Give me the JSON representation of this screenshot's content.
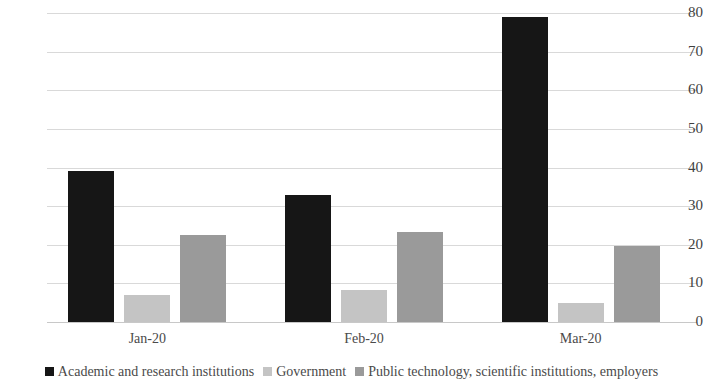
{
  "chart_data": {
    "type": "bar",
    "title": "",
    "subtitle": "",
    "xlabel": "",
    "ylabel": "",
    "categories": [
      "Jan-20",
      "Feb-20",
      "Mar-20"
    ],
    "series": [
      {
        "name": "Academic and research institutions",
        "color": "#161616",
        "values": [
          39,
          33,
          79
        ]
      },
      {
        "name": "Government",
        "color": "#c4c4c4",
        "values": [
          7,
          8.3,
          4.9
        ]
      },
      {
        "name": "Public technology, scientific institutions, employers",
        "color": "#9a9a9a",
        "values": [
          22.5,
          23.4,
          19.8
        ]
      }
    ],
    "ylim": [
      0,
      80
    ],
    "yticks": [
      0,
      10,
      20,
      30,
      40,
      50,
      60,
      70,
      80
    ],
    "ytick_labels": [
      "0",
      "10",
      "20",
      "30",
      "40",
      "50",
      "60",
      "70",
      "80"
    ],
    "grid": true,
    "legend_position": "bottom"
  }
}
